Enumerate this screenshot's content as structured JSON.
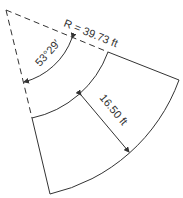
{
  "diagram": {
    "type": "annular-sector",
    "labels": {
      "radius": "R = 39.73 ft",
      "angle": "53°29′",
      "width": "16.50 ft"
    },
    "values": {
      "radius_ft": 39.73,
      "angle_deg": 53,
      "angle_min": 29,
      "width_ft": 16.5
    },
    "colors": {
      "line": "#333333",
      "background": "#ffffff"
    }
  }
}
